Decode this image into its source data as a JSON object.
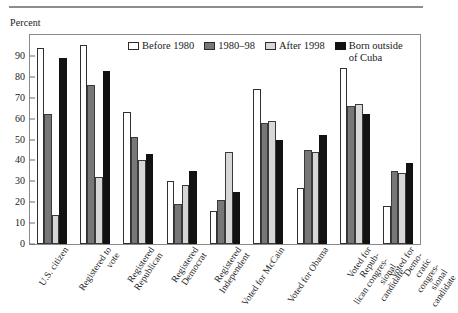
{
  "axis_caption": "Percent",
  "legend": {
    "items": [
      {
        "label": "Before 1980",
        "color": "#ffffff",
        "series_key": "before_1980"
      },
      {
        "label": "1980–98",
        "color": "#77777a",
        "series_key": "1980_98"
      },
      {
        "label": "After 1998",
        "color": "#d7d7d7",
        "series_key": "after_1998"
      },
      {
        "label": "Born outside\nof Cuba",
        "color": "#121212",
        "series_key": "born_outside_cuba"
      }
    ]
  },
  "chart_data": {
    "type": "bar",
    "title": "",
    "xlabel": "",
    "ylabel": "Percent",
    "ylim": [
      0,
      100
    ],
    "yticks": [
      0,
      10,
      20,
      30,
      40,
      50,
      60,
      70,
      80,
      90
    ],
    "grid": false,
    "legend_position": "top-center",
    "categories": [
      "U.S. citizen",
      "Registered to\nvote",
      "Registered\nRepublican",
      "Registered\nDemocrat",
      "Registered\nIndependent",
      "Voted for McCain",
      "Voted for Obama",
      "Voted for Repub-\nlican congres-\nsional candidate",
      "Voted for Demo-\ncratic congres-\nsional candidate"
    ],
    "series": [
      {
        "name": "Before 1980",
        "color": "#ffffff",
        "values": [
          94,
          95,
          63,
          30,
          16,
          74,
          27,
          84,
          18
        ]
      },
      {
        "name": "1980–98",
        "color": "#77777a",
        "values": [
          62,
          76,
          51,
          19,
          21,
          58,
          45,
          66,
          35
        ]
      },
      {
        "name": "After 1998",
        "color": "#d7d7d7",
        "values": [
          14,
          32,
          40,
          28,
          44,
          59,
          44,
          67,
          34
        ]
      },
      {
        "name": "Born outside of Cuba",
        "color": "#121212",
        "values": [
          89,
          83,
          43,
          35,
          25,
          50,
          52,
          62,
          39
        ]
      }
    ]
  }
}
